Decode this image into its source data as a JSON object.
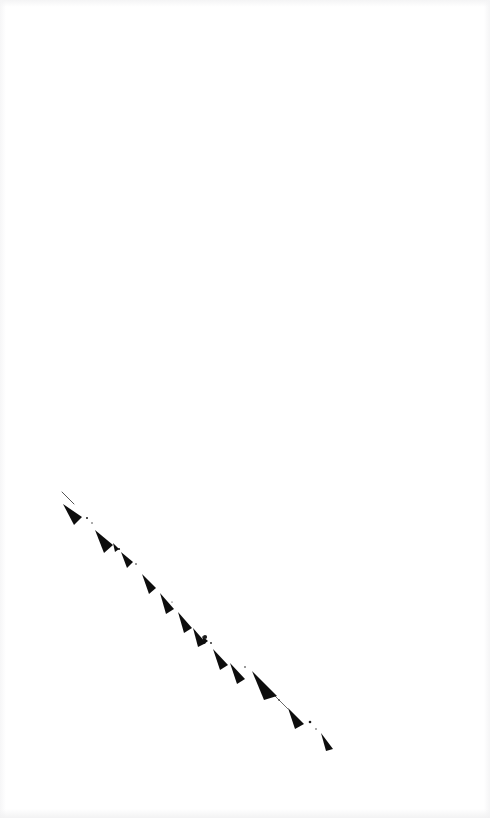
{
  "page": {
    "width": 490,
    "height": 818,
    "background_color": "#ffffff",
    "paper_tint_color": "#f4f4f5"
  },
  "artwork": {
    "name": "diagonal-dashed-stroke",
    "description": "A single broken diagonal line of dark wedge-shaped arrowhead marks descending from upper-left to lower-right across the lower-left quadrant of an otherwise blank page.",
    "ink_color": "#0d0d0d",
    "start_point": [
      62,
      492
    ],
    "end_point": [
      333,
      750
    ],
    "angle_degrees": 44,
    "mark_count": 14,
    "hairlines": [
      {
        "name": "lead-in-hairline",
        "x1": 62,
        "y1": 492,
        "x2": 74,
        "y2": 504,
        "width": 0.8
      },
      {
        "name": "tail-hairline",
        "x1": 275,
        "y1": 696,
        "x2": 288,
        "y2": 709,
        "width": 0.7
      }
    ],
    "marks": [
      {
        "name": "wedge-1",
        "tip": [
          63,
          504
        ],
        "base_a": [
          82,
          517
        ],
        "base_b": [
          74,
          525
        ],
        "opacity": 1
      },
      {
        "name": "wedge-2",
        "tip": [
          95,
          530
        ],
        "base_a": [
          113,
          545
        ],
        "base_b": [
          104,
          553
        ],
        "opacity": 1
      },
      {
        "name": "wedge-3",
        "tip": [
          121,
          552
        ],
        "base_a": [
          133,
          562
        ],
        "base_b": [
          127,
          568
        ],
        "opacity": 1
      },
      {
        "name": "wedge-4",
        "tip": [
          142,
          574
        ],
        "base_a": [
          156,
          588
        ],
        "base_b": [
          149,
          594
        ],
        "opacity": 1
      },
      {
        "name": "wedge-5",
        "tip": [
          160,
          593
        ],
        "base_a": [
          174,
          609
        ],
        "base_b": [
          166,
          614
        ],
        "opacity": 1
      },
      {
        "name": "wedge-6",
        "tip": [
          178,
          612
        ],
        "base_a": [
          192,
          628
        ],
        "base_b": [
          184,
          633
        ],
        "opacity": 1
      },
      {
        "name": "wedge-7",
        "tip": [
          193,
          628
        ],
        "base_a": [
          206,
          643
        ],
        "base_b": [
          198,
          647
        ],
        "opacity": 1
      },
      {
        "name": "wedge-8",
        "tip": [
          213,
          649
        ],
        "base_a": [
          228,
          665
        ],
        "base_b": [
          220,
          670
        ],
        "opacity": 1
      },
      {
        "name": "wedge-9",
        "tip": [
          230,
          663
        ],
        "base_a": [
          245,
          679
        ],
        "base_b": [
          237,
          684
        ],
        "opacity": 1
      },
      {
        "name": "wedge-10",
        "tip": [
          252,
          671
        ],
        "base_a": [
          277,
          696
        ],
        "base_b": [
          264,
          700
        ],
        "opacity": 1
      },
      {
        "name": "wedge-11",
        "tip": [
          288,
          708
        ],
        "base_a": [
          304,
          724
        ],
        "base_b": [
          295,
          729
        ],
        "opacity": 1
      },
      {
        "name": "wedge-12",
        "tip": [
          321,
          733
        ],
        "base_a": [
          333,
          749
        ],
        "base_b": [
          326,
          751
        ],
        "opacity": 1
      },
      {
        "name": "wedge-13",
        "tip": [
          113,
          543
        ],
        "base_a": [
          119,
          549
        ],
        "base_b": [
          115,
          552
        ],
        "opacity": 1
      },
      {
        "name": "wedge-14",
        "tip": [
          202,
          636
        ],
        "base_a": [
          208,
          641
        ],
        "base_b": [
          204,
          644
        ],
        "opacity": 1
      }
    ],
    "specks": [
      {
        "name": "speck-1",
        "cx": 87,
        "cy": 518,
        "r": 1.0
      },
      {
        "name": "speck-2",
        "cx": 92,
        "cy": 523,
        "r": 0.7
      },
      {
        "name": "speck-3",
        "cx": 119,
        "cy": 549,
        "r": 1.1
      },
      {
        "name": "speck-4",
        "cx": 136,
        "cy": 564,
        "r": 0.8
      },
      {
        "name": "speck-5",
        "cx": 205,
        "cy": 637,
        "r": 2.1
      },
      {
        "name": "speck-6",
        "cx": 211,
        "cy": 643,
        "r": 0.9
      },
      {
        "name": "speck-7",
        "cx": 279,
        "cy": 700,
        "r": 0.8
      },
      {
        "name": "speck-8",
        "cx": 310,
        "cy": 722,
        "r": 1.3
      },
      {
        "name": "speck-9",
        "cx": 316,
        "cy": 729,
        "r": 0.7
      },
      {
        "name": "speck-10",
        "cx": 245,
        "cy": 667,
        "r": 0.8
      },
      {
        "name": "speck-11",
        "cx": 172,
        "cy": 602,
        "r": 0.6
      }
    ]
  }
}
